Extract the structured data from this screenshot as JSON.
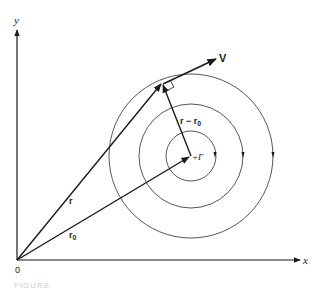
{
  "diagram": {
    "type": "vector-vortex-diagram",
    "axes": {
      "x_label": "x",
      "y_label": "y",
      "origin_label": "0"
    },
    "vectors": [
      {
        "name": "r",
        "label": "r",
        "from": "origin",
        "to": "point on outer circle"
      },
      {
        "name": "r0",
        "label": "r",
        "subscript": "0",
        "from": "origin",
        "to": "vortex center"
      },
      {
        "name": "r-r0",
        "label": "r − r",
        "subscript": "0",
        "from": "vortex center",
        "to": "point on outer circle"
      },
      {
        "name": "V",
        "label": "V",
        "from": "point on outer circle",
        "direction": "tangent"
      }
    ],
    "vortex": {
      "label": "+Γ",
      "circles": 3,
      "rotation": "clockwise"
    },
    "right_angle_marker": true
  },
  "caption": {
    "text": "FIGURE"
  }
}
